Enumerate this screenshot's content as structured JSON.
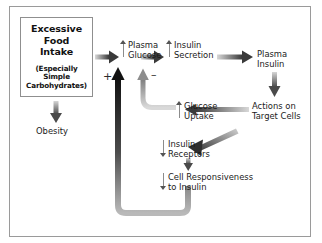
{
  "figure": {
    "background": "#ffffff",
    "border_color": "#9a9a9a"
  },
  "source_box": {
    "name": "excessive-food-intake",
    "line1": "Excessive",
    "line2": "Food",
    "line3": "Intake",
    "sub1": "(Especially",
    "sub2": "Simple",
    "sub3": "Carbohydrates)"
  },
  "nodes": {
    "obesity": {
      "label": "Obesity",
      "glyph": "none"
    },
    "plasma_glucose": {
      "line1": "Plasma",
      "line2": "Glucose",
      "glyph": "up"
    },
    "insulin_secretion": {
      "line1": "Insulin",
      "line2": "Secretion",
      "glyph": "up"
    },
    "plasma_insulin": {
      "line1": "Plasma",
      "line2": "Insulin",
      "glyph": "none"
    },
    "actions_on_target_cells": {
      "line1": "Actions on",
      "line2": "Target Cells",
      "glyph": "none"
    },
    "glucose_uptake": {
      "line1": "Glucose",
      "line2": "Uptake",
      "glyph": "up"
    },
    "insulin_receptors": {
      "line1": "Insulin",
      "line2": "Receptors",
      "glyph": "down"
    },
    "cell_responsiveness": {
      "line1": "Cell Responsiveness",
      "line2": "to Insulin",
      "glyph": "down"
    }
  },
  "signs": {
    "plus": "+",
    "minus": "–"
  },
  "colors": {
    "arrow_dark": "#3a3a3a",
    "arrow_mid": "#6e6e6e",
    "arrow_light": "#c9c9c9",
    "glyph": "#8c8c8c",
    "text": "#1a1a1a"
  },
  "edges": [
    {
      "name": "intake-to-plasma-glucose",
      "from": "excessive-food-intake",
      "to": "plasma-glucose",
      "style": "thick-gradient-right"
    },
    {
      "name": "intake-to-obesity",
      "from": "excessive-food-intake",
      "to": "obesity",
      "style": "thick-gradient-down"
    },
    {
      "name": "plasma-glucose-to-insulin-secretion",
      "from": "plasma-glucose",
      "to": "insulin-secretion",
      "style": "thick-gradient-right"
    },
    {
      "name": "insulin-secretion-to-plasma-insulin",
      "from": "insulin-secretion",
      "to": "plasma-insulin",
      "style": "thick-gradient-right"
    },
    {
      "name": "plasma-insulin-to-actions",
      "from": "plasma-insulin",
      "to": "actions-on-target-cells",
      "style": "thick-gradient-down"
    },
    {
      "name": "actions-to-glucose-uptake",
      "from": "actions-on-target-cells",
      "to": "glucose-uptake",
      "style": "thick-gradient-left"
    },
    {
      "name": "glucose-uptake-to-plasma-glucose",
      "from": "glucose-uptake",
      "to": "plasma-glucose",
      "style": "gray-elbow-up",
      "sign": "–"
    },
    {
      "name": "cell-responsiveness-to-plasma-glucose",
      "from": "cell-responsiveness-to-insulin",
      "to": "plasma-glucose",
      "style": "black-elbow-up",
      "sign": "+"
    },
    {
      "name": "actions-to-insulin-receptors",
      "from": "actions-on-target-cells",
      "to": "insulin-receptors",
      "style": "diagonal-down-left"
    },
    {
      "name": "insulin-receptors-to-cell-responsiveness",
      "from": "insulin-receptors",
      "to": "cell-responsiveness-to-insulin",
      "style": "short-down"
    }
  ]
}
